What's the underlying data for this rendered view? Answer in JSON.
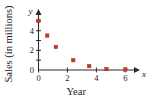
{
  "chart_data": {
    "type": "scatter",
    "title": "",
    "xlabel": "Year",
    "ylabel": "Sales (in millions)",
    "x_var_label": "x",
    "y_var_label": "y",
    "xlim": [
      0,
      6.6
    ],
    "ylim": [
      0,
      5.6
    ],
    "xticks": [
      0,
      2,
      4,
      6
    ],
    "xtick_labels": [
      "0",
      "2",
      "4",
      "6"
    ],
    "yticks": [
      0,
      2,
      4
    ],
    "ytick_labels": [
      "0",
      "2",
      "4"
    ],
    "minor_yticks": [
      1,
      3,
      5
    ],
    "grid": false,
    "legend": null,
    "marker_color": "#c0392b",
    "marker_shape": "square",
    "axis_color": "#2b2b2b",
    "points": [
      {
        "x": 0.0,
        "y": 5.0
      },
      {
        "x": 0.6,
        "y": 3.5
      },
      {
        "x": 1.2,
        "y": 2.35
      },
      {
        "x": 2.4,
        "y": 1.0
      },
      {
        "x": 3.5,
        "y": 0.4
      },
      {
        "x": 4.7,
        "y": 0.1
      },
      {
        "x": 6.0,
        "y": 0.05
      }
    ]
  },
  "axis_titles": {
    "x": "Year",
    "y": "Sales (in millions)"
  },
  "tick_labels": {
    "x": [
      "0",
      "2",
      "4",
      "6"
    ],
    "y": [
      "0",
      "2",
      "4"
    ]
  },
  "variables": {
    "x": "x",
    "y": "y"
  }
}
